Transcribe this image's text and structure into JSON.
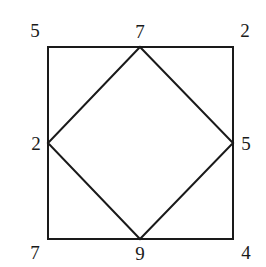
{
  "diagram": {
    "stroke_color": "#1a1a1a",
    "background": "#ffffff",
    "outer_square": {
      "corners": {
        "top_left": {
          "label": "5",
          "x": 48,
          "y": 47
        },
        "top_right": {
          "label": "2",
          "x": 233,
          "y": 47
        },
        "bottom_right": {
          "label": "4",
          "x": 233,
          "y": 239
        },
        "bottom_left": {
          "label": "7",
          "x": 48,
          "y": 239
        }
      }
    },
    "inner_diamond": {
      "vertices": {
        "top_mid": {
          "label": "7",
          "x": 140,
          "y": 47
        },
        "right_mid": {
          "label": "5",
          "x": 233,
          "y": 143
        },
        "bottom_mid": {
          "label": "9",
          "x": 140,
          "y": 239
        },
        "left_mid": {
          "label": "2",
          "x": 48,
          "y": 143
        }
      }
    }
  }
}
